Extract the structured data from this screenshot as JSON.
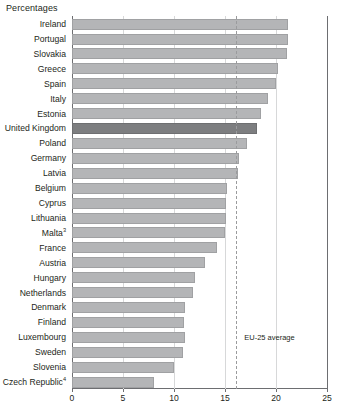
{
  "chart_data": {
    "type": "bar",
    "orientation": "horizontal",
    "title": "",
    "xlabel": "Percentages",
    "ylabel": "",
    "xlim": [
      0,
      25
    ],
    "xticks": [
      0,
      5,
      10,
      15,
      20,
      25
    ],
    "xtick_labels": [
      "0",
      "5",
      "10",
      "15",
      "20",
      "25"
    ],
    "grid": true,
    "grid_axis": "x",
    "legend": "none",
    "categories": [
      "Ireland",
      "Portugal",
      "Slovakia",
      "Greece",
      "Spain",
      "Italy",
      "Estonia",
      "United Kingdom",
      "Poland",
      "Germany",
      "Latvia",
      "Belgium",
      "Cyprus",
      "Lithuania",
      "Malta",
      "France",
      "Austria",
      "Hungary",
      "Netherlands",
      "Denmark",
      "Finland",
      "Luxembourg",
      "Sweden",
      "Slovenia",
      "Czech Republic"
    ],
    "category_footnotes": {
      "Malta": "3",
      "Czech Republic": "4"
    },
    "values": [
      21.2,
      21.2,
      21.1,
      20.2,
      20.0,
      19.2,
      18.5,
      18.1,
      17.2,
      16.4,
      16.3,
      15.2,
      15.1,
      15.1,
      15.0,
      14.2,
      13.0,
      12.1,
      11.9,
      11.1,
      11.0,
      11.1,
      10.9,
      10.0,
      8.0
    ],
    "highlighted_category": "United Kingdom",
    "annotations": [
      {
        "name": "eu-25-average",
        "label": "EU-25 average",
        "value": 16.1,
        "style": "dashed-vertical-line"
      }
    ],
    "colors": {
      "bar": "#b4b5b7",
      "bar_highlight": "#7d7e80",
      "axis": "#6d6e71",
      "gridline": "#d7d8d9",
      "average_line": "#9a9b9d",
      "text": "#231f20",
      "background": "#ffffff"
    }
  }
}
